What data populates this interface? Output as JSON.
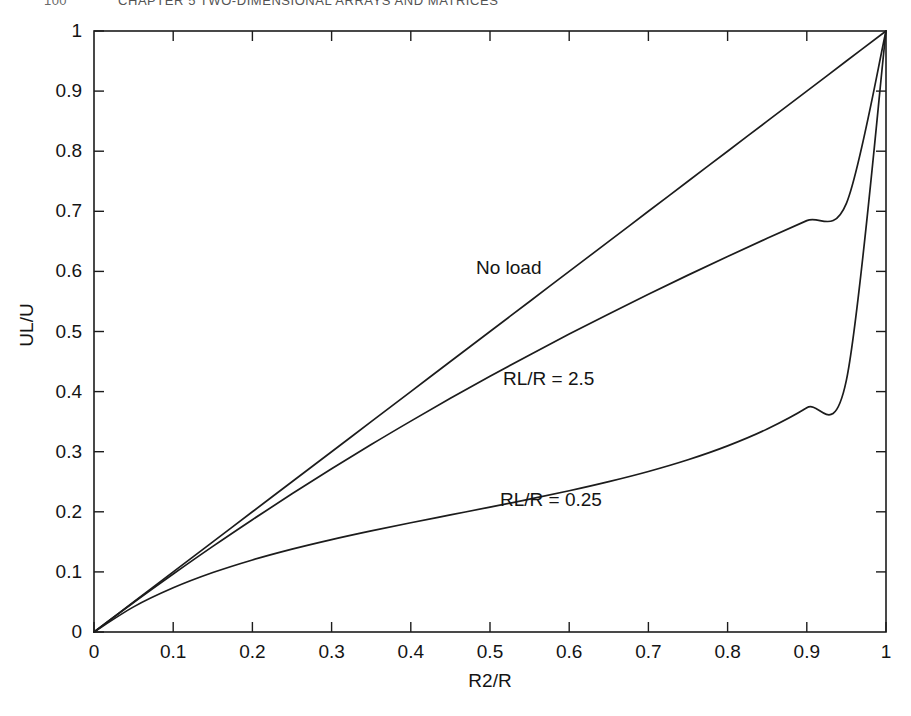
{
  "page": {
    "folio": "100",
    "running_title": "CHAPTER 5  TWO-DIMENSIONAL ARRAYS AND MATRICES"
  },
  "chart_data": {
    "type": "line",
    "title": "",
    "subtitle": "",
    "xlabel": "R2/R",
    "ylabel": "UL/U",
    "xlim": [
      0,
      1
    ],
    "ylim": [
      0,
      1
    ],
    "grid": false,
    "legend": "in-plot annotations",
    "xticks": [
      "0",
      "0.1",
      "0.2",
      "0.3",
      "0.4",
      "0.5",
      "0.6",
      "0.7",
      "0.8",
      "0.9",
      "1"
    ],
    "yticks": [
      "0",
      "0.1",
      "0.2",
      "0.3",
      "0.4",
      "0.5",
      "0.6",
      "0.7",
      "0.8",
      "0.9",
      "1"
    ],
    "xtick_values": [
      0,
      0.1,
      0.2,
      0.3,
      0.4,
      0.5,
      0.6,
      0.7,
      0.8,
      0.9,
      1
    ],
    "ytick_values": [
      0,
      0.1,
      0.2,
      0.3,
      0.4,
      0.5,
      0.6,
      0.7,
      0.8,
      0.9,
      1
    ],
    "x": [
      0,
      0.05,
      0.1,
      0.15,
      0.2,
      0.25,
      0.3,
      0.35,
      0.4,
      0.45,
      0.5,
      0.55,
      0.6,
      0.65,
      0.7,
      0.75,
      0.8,
      0.85,
      0.9,
      0.95,
      1
    ],
    "series": [
      {
        "name": "No load",
        "label": "No load",
        "annotation_position": "above-upper-curve",
        "values": [
          0,
          0.05,
          0.1,
          0.15,
          0.2,
          0.25,
          0.3,
          0.35,
          0.4,
          0.45,
          0.5,
          0.55,
          0.6,
          0.65,
          0.7,
          0.75,
          0.8,
          0.85,
          0.9,
          0.95,
          1
        ]
      },
      {
        "name": "RL/R = 2.5",
        "label": "RL/R = 2.5",
        "annotation_position": "right-of-middle-curve",
        "values": [
          0,
          0.0491,
          0.0965,
          0.1425,
          0.1869,
          0.2299,
          0.2715,
          0.3119,
          0.3509,
          0.3888,
          0.4255,
          0.4611,
          0.4957,
          0.5293,
          0.562,
          0.5938,
          0.6248,
          0.655,
          0.6845,
          0.7133,
          1
        ]
      },
      {
        "name": "RL/R = 0.25",
        "label": "RL/R = 0.25",
        "annotation_position": "right-of-lower-curve",
        "values": [
          0,
          0.0418,
          0.0735,
          0.0989,
          0.1199,
          0.1379,
          0.1538,
          0.1683,
          0.1818,
          0.1948,
          0.2078,
          0.221,
          0.235,
          0.2502,
          0.2671,
          0.2866,
          0.3097,
          0.3378,
          0.3731,
          0.4191,
          1
        ]
      }
    ]
  }
}
